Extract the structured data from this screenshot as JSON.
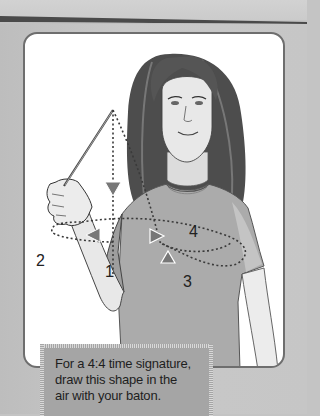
{
  "illustration": {
    "subject": "girl conducting with baton",
    "beat_labels": [
      "1",
      "2",
      "3",
      "4"
    ],
    "icons": [
      "baton-icon",
      "arrow-down-icon",
      "arrow-left-icon",
      "arrow-right-icon",
      "arrow-up-icon"
    ]
  },
  "caption": {
    "lines": [
      "For a 4:4 time signature,",
      "draw this shape in the",
      "air with your baton."
    ]
  },
  "colors": {
    "page_bg": "#c4c4c4",
    "panel_bg": "#ffffff",
    "panel_border": "#6e6e6e",
    "caption_bg": "#a5a5a5",
    "hair": "#4a4a4a",
    "shirt": "#a8a8a8",
    "skin": "#e6e6e6",
    "path_dots": "#3a3a3a"
  }
}
